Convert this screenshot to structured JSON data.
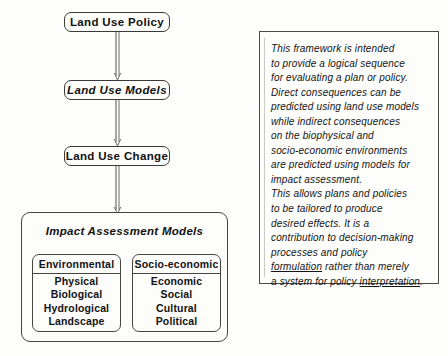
{
  "diagram": {
    "flow_nodes": [
      {
        "id": "land-use-policy",
        "label": "Land Use Policy",
        "italic": false
      },
      {
        "id": "land-use-models",
        "label": "Land Use Models",
        "italic": true
      },
      {
        "id": "land-use-change",
        "label": "Land Use Change",
        "italic": false
      }
    ],
    "connectors": [
      {
        "id": "policy-to-models",
        "from": "land-use-policy",
        "to": "land-use-models",
        "style": "double-line-open-arrow",
        "direction": "down"
      },
      {
        "id": "models-to-change",
        "from": "land-use-models",
        "to": "land-use-change",
        "style": "double-line-open-arrow",
        "direction": "down"
      },
      {
        "id": "change-to-impact",
        "from": "land-use-change",
        "to": "impact-assessment-models",
        "style": "double-line-open-arrow",
        "direction": "down"
      }
    ],
    "impact_container": {
      "title": "Impact Assessment Models",
      "categories": [
        {
          "id": "environmental",
          "header": "Environmental",
          "items": [
            "Physical",
            "Biological",
            "Hydrological",
            "Landscape"
          ]
        },
        {
          "id": "socio-economic",
          "header": "Socio-economic",
          "items": [
            "Economic",
            "Social",
            "Cultural",
            "Political"
          ]
        }
      ]
    }
  },
  "note_panel": {
    "lines": [
      "This framework is intended",
      "to provide a logical sequence",
      "for evaluating a plan or policy.",
      "Direct consequences can be",
      "predicted using land use models",
      "while indirect consequences",
      "on the biophysical and",
      "socio-economic environments",
      "are predicted using models for",
      "impact assessment.",
      "This allows plans and policies",
      "to be tailored to produce",
      "desired effects.  It is a",
      "contribution to decision-making",
      "processes and policy"
    ],
    "line_16": {
      "underlined": "formulation",
      "rest": " rather than merely"
    },
    "line_17": {
      "before": "a system for policy ",
      "underlined": "interpretation",
      "after": "."
    }
  },
  "colors": {
    "background": "#fdfdfc",
    "ink": "#121211",
    "border": "#46463f"
  }
}
